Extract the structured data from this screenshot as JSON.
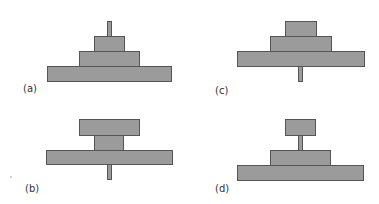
{
  "figure": {
    "colors": {
      "background": "#ffffff",
      "block_fill": "#9b9b9b",
      "block_border": "#555555",
      "label_text": "#333333"
    },
    "panels": [
      {
        "id": "a",
        "label": "(a)",
        "description": "Three stacked blocks decreasing in width upward, pin protruding from top"
      },
      {
        "id": "b",
        "label": "(b)",
        "description": "Wide block on top of narrow block on wide base, pin protruding from bottom"
      },
      {
        "id": "c",
        "label": "(c)",
        "description": "Three stacked blocks decreasing in width upward, pin protruding from bottom"
      },
      {
        "id": "d",
        "label": "(d)",
        "description": "Small block raised on pin above two stacked blocks"
      }
    ]
  }
}
